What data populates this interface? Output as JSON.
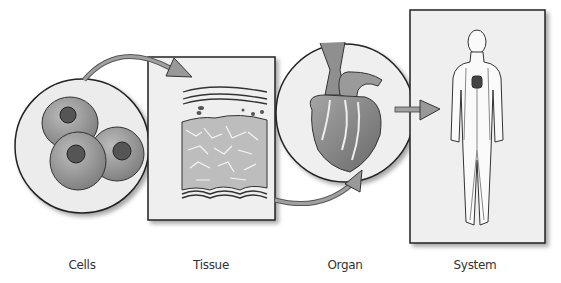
{
  "diagram": {
    "type": "levels-of-organization",
    "stages": [
      {
        "id": "cells",
        "label": "Cells",
        "x": 82
      },
      {
        "id": "tissue",
        "label": "Tissue",
        "x": 211
      },
      {
        "id": "organ",
        "label": "Organ",
        "x": 345
      },
      {
        "id": "system",
        "label": "System",
        "x": 475
      }
    ],
    "colors": {
      "panel_fill": "#efefef",
      "outline": "#222222",
      "arrow_fill": "#9a9a9a",
      "cell_fill": "#9c9c9c",
      "nucleus_fill": "#555555",
      "tissue_fill": "#bdbdbd"
    }
  }
}
